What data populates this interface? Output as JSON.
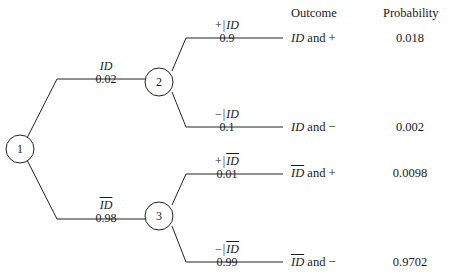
{
  "headers": {
    "outcome": "Outcome",
    "probability": "Probability"
  },
  "nodes": [
    {
      "id": "1",
      "label": "1"
    },
    {
      "id": "2",
      "label": "2"
    },
    {
      "id": "3",
      "label": "3"
    }
  ],
  "branches": {
    "first_stage": [
      {
        "event": "ID",
        "overline": false,
        "prob": "0.02"
      },
      {
        "event": "ID",
        "overline": true,
        "prob": "0.98"
      }
    ],
    "second_stage": [
      {
        "sign": "+",
        "bar": "|",
        "event": "ID",
        "overline": false,
        "prob": "0.9"
      },
      {
        "sign": "−",
        "bar": "|",
        "event": "ID",
        "overline": false,
        "prob": "0.1"
      },
      {
        "sign": "+",
        "bar": "|",
        "event": "ID",
        "overline": true,
        "prob": "0.01"
      },
      {
        "sign": "−",
        "bar": "|",
        "event": "ID",
        "overline": true,
        "prob": "0.99"
      }
    ]
  },
  "rows": [
    {
      "event": "ID",
      "overline": false,
      "conjunction": " and ",
      "sign": "+",
      "probability": "0.018"
    },
    {
      "event": "ID",
      "overline": false,
      "conjunction": " and ",
      "sign": "−",
      "probability": "0.002"
    },
    {
      "event": "ID",
      "overline": true,
      "conjunction": " and ",
      "sign": "+",
      "probability": "0.0098"
    },
    {
      "event": "ID",
      "overline": true,
      "conjunction": " and ",
      "sign": "−",
      "probability": "0.9702"
    }
  ],
  "colors": {
    "stroke": "#222222",
    "text": "#1a1a1a",
    "background": "#ffffff"
  }
}
